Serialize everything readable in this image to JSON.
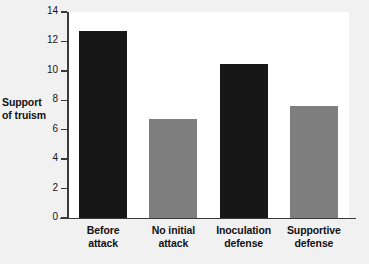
{
  "chart_data": {
    "type": "bar",
    "title": "",
    "xlabel": "",
    "ylabel": "Support of truism",
    "ylabel_line1": "Support",
    "ylabel_line2": "of truism",
    "ylim": [
      0,
      14
    ],
    "ytick_step": 2,
    "yticks": [
      "0",
      "2",
      "4",
      "6",
      "8",
      "10",
      "12",
      "14"
    ],
    "grid": false,
    "legend": "none",
    "categories": [
      "Before attack",
      "No initial attack",
      "Inoculation defense",
      "Supportive defense"
    ],
    "category_lines": [
      [
        "Before",
        "attack"
      ],
      [
        "No initial",
        "attack"
      ],
      [
        "Inoculation",
        "defense"
      ],
      [
        "Supportive",
        "defense"
      ]
    ],
    "values": [
      12.7,
      6.7,
      10.45,
      7.6
    ],
    "bar_colors": [
      "#171717",
      "#7f7f7f",
      "#171717",
      "#7f7f7f"
    ],
    "series": [
      {
        "name": "Support of truism",
        "values": [
          12.7,
          6.7,
          10.45,
          7.6
        ]
      }
    ]
  },
  "colors": {
    "background": "#f1f1f1",
    "plot_background": "#ffffff",
    "axis": "#3a3a3a",
    "bar_dark": "#171717",
    "bar_light": "#7f7f7f",
    "text": "#121212"
  }
}
